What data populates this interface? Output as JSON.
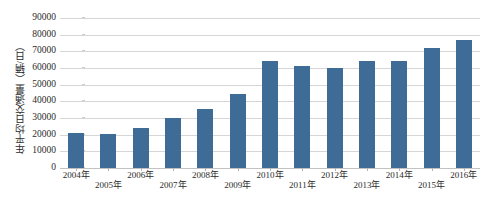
{
  "chart_data": {
    "type": "bar",
    "title": "",
    "xlabel": "",
    "ylabel": "年平均日交通量（辆/日）",
    "categories": [
      "2004年",
      "2005年",
      "2006年",
      "2007年",
      "2008年",
      "2009年",
      "2010年",
      "2011年",
      "2012年",
      "2013年",
      "2014年",
      "2015年",
      "2016年"
    ],
    "values": [
      21000,
      20700,
      24300,
      30000,
      35700,
      44500,
      64000,
      61000,
      60000,
      64500,
      64000,
      72000,
      77000
    ],
    "ylim": [
      0,
      90000
    ],
    "ytick_step": 10000,
    "yticks": [
      "0",
      "10000",
      "20000",
      "30000",
      "40000",
      "50000",
      "60000",
      "70000",
      "80000",
      "90000"
    ],
    "grid": true,
    "legend": "none",
    "bar_color": "#3e6c96",
    "gridline_color": "#d6d6d6",
    "background_color": "#ffffff",
    "axis_text_color": "#2b2b2b"
  }
}
